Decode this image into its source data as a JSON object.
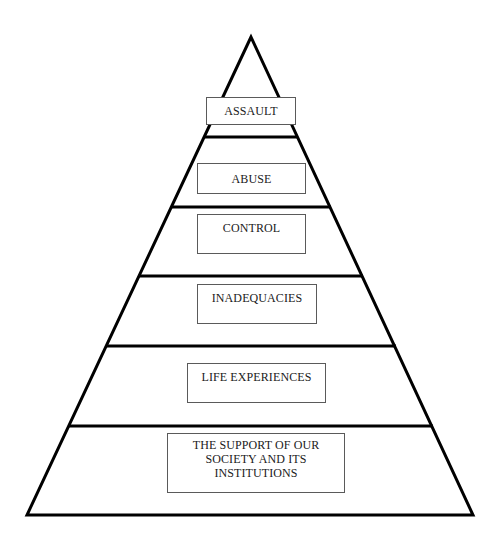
{
  "diagram": {
    "type": "pyramid",
    "stroke_color": "#000000",
    "box_border_color": "#5a5a5a",
    "levels": [
      {
        "label": "ASSAULT"
      },
      {
        "label": "ABUSE"
      },
      {
        "label": "CONTROL"
      },
      {
        "label": "INADEQUACIES"
      },
      {
        "label": "LIFE EXPERIENCES"
      },
      {
        "label": "THE SUPPORT OF OUR\nSOCIETY AND ITS\nINSTITUTIONS"
      }
    ]
  }
}
